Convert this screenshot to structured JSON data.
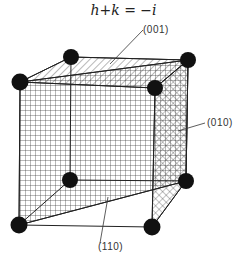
{
  "equation": "h+k = −i",
  "labels": {
    "plane_001": "(001)",
    "plane_010": "(010)",
    "plane_110": "(110)"
  },
  "colors": {
    "line": "#222222",
    "atom": "#111111",
    "background": "#ffffff"
  }
}
